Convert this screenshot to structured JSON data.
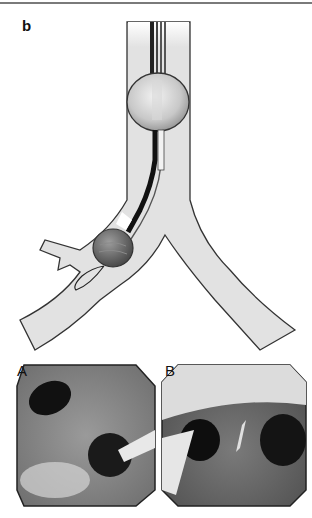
{
  "figure": {
    "panel_label": "b",
    "diagram": {
      "description": "Bronchial blocker placed through endotracheal tube into left main bronchus",
      "colors": {
        "airway_fill": "#e2e2e2",
        "outline": "#333333",
        "balloon": "#bdbdbd",
        "blocker_balloon": "#7a7a7a"
      }
    },
    "photos": [
      {
        "label": "A",
        "description": "Endoscopic view, blocker entering bronchus"
      },
      {
        "label": "B",
        "description": "Endoscopic view of carina with blocker"
      }
    ]
  }
}
